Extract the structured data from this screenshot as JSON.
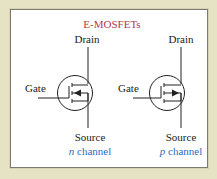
{
  "title": "E-MOSFETs",
  "colors": {
    "background": "#e6e2c4",
    "panel": "#ffffff",
    "title": "#b23a4e",
    "channel_label": "#2a6ec0",
    "lines": "#222222"
  },
  "symbols": [
    {
      "id": "n-channel",
      "drain_label": "Drain",
      "gate_label": "Gate",
      "source_label": "Source",
      "channel_letter": "n",
      "channel_word": "channel",
      "arrow_direction": "inward"
    },
    {
      "id": "p-channel",
      "drain_label": "Drain",
      "gate_label": "Gate",
      "source_label": "Source",
      "channel_letter": "p",
      "channel_word": "channel",
      "arrow_direction": "outward"
    }
  ]
}
